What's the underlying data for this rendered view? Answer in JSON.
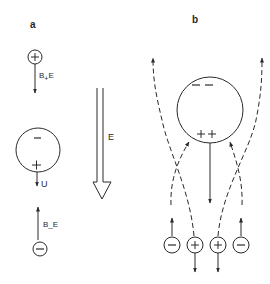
{
  "panels": {
    "a": {
      "label": "a",
      "top_ion": {
        "sign": "+",
        "force_label": "B+E",
        "force_main": "B",
        "force_sub": "+",
        "force_tail": "E"
      },
      "drop": {
        "top_sign": "−",
        "bottom_sign": "+",
        "velocity_label": "U"
      },
      "bottom_ion": {
        "sign": "−",
        "force_label": "B_E",
        "force_main": "B",
        "force_sub": "_",
        "force_tail": "E"
      },
      "field": {
        "label": "E"
      }
    },
    "b": {
      "label": "b",
      "drop": {
        "top_signs": "− −",
        "bottom_signs": "+ +"
      },
      "ions": [
        {
          "sign": "−"
        },
        {
          "sign": "+"
        },
        {
          "sign": "+"
        },
        {
          "sign": "−"
        }
      ]
    }
  },
  "colors": {
    "stroke": "#2a2a2a",
    "background": "#ffffff"
  }
}
